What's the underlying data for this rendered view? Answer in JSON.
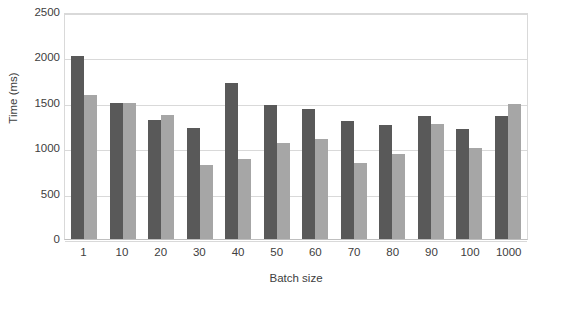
{
  "chart_data": {
    "type": "bar",
    "title": "",
    "subtitle": "",
    "xlabel": "Batch size",
    "ylabel": "Time (ms)",
    "categories": [
      "1",
      "10",
      "20",
      "30",
      "40",
      "50",
      "60",
      "70",
      "80",
      "90",
      "100",
      "1000"
    ],
    "series": [
      {
        "name": "series-1-dark",
        "color": "#595959",
        "values": [
          2020,
          1500,
          1310,
          1225,
          1715,
          1475,
          1430,
          1300,
          1255,
          1360,
          1210,
          1355
        ]
      },
      {
        "name": "series-2-light",
        "color": "#a6a6a6",
        "values": [
          1590,
          1500,
          1365,
          810,
          885,
          1055,
          1100,
          835,
          935,
          1265,
          1000,
          1485
        ]
      }
    ],
    "ylim": [
      0,
      2500
    ],
    "y_ticks": [
      0,
      500,
      1000,
      1500,
      2000,
      2500
    ],
    "y_tick_labels": [
      "0",
      "500",
      "1000",
      "1500",
      "2000",
      "2500"
    ],
    "grid": true,
    "grid_axis": "y",
    "legend": false,
    "legend_position": "none",
    "plot_background": "#ffffff",
    "grid_color": "#d9d9d9",
    "axis_color": "#bfbfbf",
    "text_color": "#404040"
  }
}
